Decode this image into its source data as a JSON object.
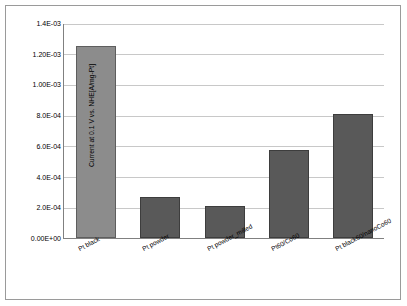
{
  "chart_data": {
    "type": "bar",
    "title": "",
    "xlabel": "",
    "ylabel": "Current at 0.1 V vs. NHE[A/mg-Pt]",
    "categories": [
      "Pt black",
      "Pt powder",
      "Pt powder_milled",
      "Pt60/Co60",
      "Pt black60/nanoCo60"
    ],
    "values": [
      0.00125,
      0.00027,
      0.00021,
      0.00057,
      0.00081
    ],
    "ylim": [
      0.0,
      0.0014
    ],
    "yticks": [
      0.0,
      0.0002,
      0.0004,
      0.0006,
      0.0008,
      0.001,
      0.0012,
      0.0014
    ],
    "ytick_labels": [
      "0.00E+00",
      "2.0E-04",
      "4.0E-04",
      "6.0E-04",
      "8.0E-04",
      "1.00E-03",
      "1.20E-03",
      "1.4E-03"
    ],
    "grid": true,
    "legend": "none",
    "series_color": "#595959",
    "first_bar_color": "#8c8c8c",
    "frame_color": "#9a9a9a"
  }
}
